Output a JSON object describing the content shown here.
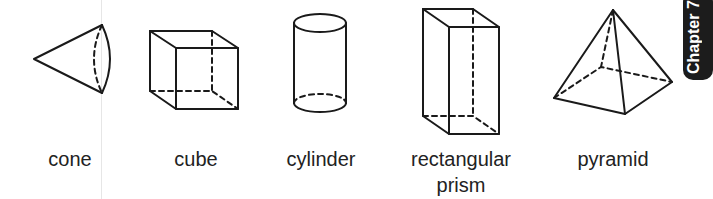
{
  "chapter_tab": {
    "text": "Chapter 7",
    "color": "#1c1c1c"
  },
  "shapes": [
    {
      "id": "cone",
      "label_lines": [
        "cone"
      ],
      "label_center_x": 70
    },
    {
      "id": "cube",
      "label_lines": [
        "cube"
      ],
      "label_center_x": 196
    },
    {
      "id": "cylinder",
      "label_lines": [
        "cylinder"
      ],
      "label_center_x": 321
    },
    {
      "id": "rectangular-prism",
      "label_lines": [
        "rectangular",
        "prism"
      ],
      "label_center_x": 461
    },
    {
      "id": "pyramid",
      "label_lines": [
        "pyramid"
      ],
      "label_center_x": 613
    }
  ],
  "colors": {
    "line": "#1a1a1a",
    "text": "#222222",
    "background": "#ffffff"
  }
}
